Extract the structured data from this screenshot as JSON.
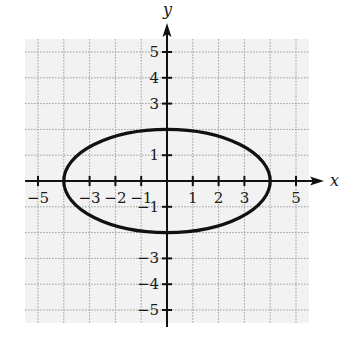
{
  "chart_data": {
    "type": "line",
    "title": "",
    "xlabel": "x",
    "ylabel": "y",
    "xlim": [
      -5.5,
      5.5
    ],
    "ylim": [
      -5.5,
      5.5
    ],
    "grid": true,
    "legend": null,
    "x_tick_labels": [
      "-5",
      "-3",
      "-2",
      "-1",
      "1",
      "2",
      "3",
      "5"
    ],
    "x_tick_values": [
      -5,
      -3,
      -2,
      -1,
      1,
      2,
      3,
      5
    ],
    "y_tick_labels": [
      "5",
      "4",
      "3",
      "1",
      "-1",
      "-3",
      "-4",
      "-5"
    ],
    "y_tick_values": [
      5,
      4,
      3,
      1,
      -1,
      -3,
      -4,
      -5
    ],
    "ticks_x": [
      -5,
      -4,
      -3,
      -2,
      -1,
      1,
      2,
      3,
      4,
      5
    ],
    "ticks_y": [
      -5,
      -4,
      -3,
      -2,
      -1,
      1,
      2,
      3,
      4,
      5
    ],
    "series": [
      {
        "name": "ellipse",
        "shape": "ellipse",
        "equation": "x^2/16 + y^2/4 = 1",
        "center": [
          0,
          0
        ],
        "semi_axis_x": 4,
        "semi_axis_y": 2,
        "vertices": [
          [
            -4,
            0
          ],
          [
            4,
            0
          ],
          [
            0,
            2
          ],
          [
            0,
            -2
          ]
        ]
      }
    ]
  },
  "style": {
    "background": "#ffffff",
    "grid_background": "#f2f2f2",
    "grid_line_color": "#9a9a9a",
    "axis_color": "#111111",
    "curve_color": "#111111"
  },
  "labels": {
    "x_axis": "x",
    "y_axis": "y"
  }
}
